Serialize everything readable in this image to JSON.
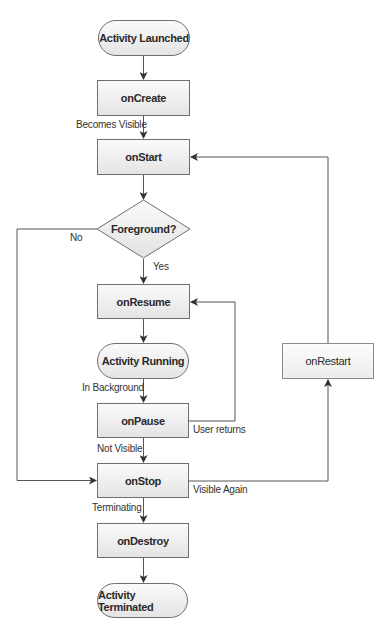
{
  "diagram": {
    "type": "flowchart",
    "nodes": {
      "activity_launched": "Activity Launched",
      "on_create": "onCreate",
      "on_start": "onStart",
      "foreground_decision": "Foreground?",
      "on_resume": "onResume",
      "activity_running": "Activity Running",
      "on_pause": "onPause",
      "on_stop": "onStop",
      "on_destroy": "onDestroy",
      "activity_terminated": "Activity Terminated",
      "on_restart": "onRestart"
    },
    "edge_labels": {
      "becomes_visible": "Becomes Visible",
      "no": "No",
      "yes": "Yes",
      "in_background": "In Background",
      "user_returns": "User returns",
      "not_visible": "Not Visible",
      "visible_again": "Visible Again",
      "terminating": "Terminating"
    },
    "edges": [
      {
        "from": "Activity Launched",
        "to": "onCreate",
        "label": ""
      },
      {
        "from": "onCreate",
        "to": "onStart",
        "label": "Becomes Visible"
      },
      {
        "from": "onStart",
        "to": "Foreground?",
        "label": ""
      },
      {
        "from": "Foreground?",
        "to": "onResume",
        "label": "Yes"
      },
      {
        "from": "Foreground?",
        "to": "onStop",
        "label": "No"
      },
      {
        "from": "onResume",
        "to": "Activity Running",
        "label": ""
      },
      {
        "from": "Activity Running",
        "to": "onPause",
        "label": "In Background"
      },
      {
        "from": "onPause",
        "to": "onResume",
        "label": "User returns"
      },
      {
        "from": "onPause",
        "to": "onStop",
        "label": "Not Visible"
      },
      {
        "from": "onStop",
        "to": "onRestart",
        "label": "Visible Again"
      },
      {
        "from": "onRestart",
        "to": "onStart",
        "label": ""
      },
      {
        "from": "onStop",
        "to": "onDestroy",
        "label": "Terminating"
      },
      {
        "from": "onDestroy",
        "to": "Activity Terminated",
        "label": ""
      }
    ],
    "colors": {
      "stroke": "#555555",
      "node_fill_top": "#fafafa",
      "node_fill_bottom": "#e4e4e4",
      "text": "#2a2a2a"
    }
  }
}
